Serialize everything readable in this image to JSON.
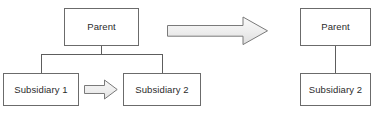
{
  "diagram": {
    "type": "before-after-org-restructure",
    "colors": {
      "box_stroke": "#6b6b6b",
      "box_fill": "#ffffff",
      "connector": "#5d5d5d",
      "arrow_stroke": "#7a7a7a",
      "arrow_fill_top": "#f4f4f4",
      "arrow_fill_bottom": "#e2e2e2",
      "text": "#2b2b2b",
      "background": "#ffffff"
    },
    "before": {
      "parent": {
        "label": "Parent"
      },
      "subsidiary_1": {
        "label": "Subsidiary 1"
      },
      "subsidiary_2": {
        "label": "Subsidiary 2"
      },
      "inline_arrow": {
        "direction": "right",
        "meaning": "merge-into"
      }
    },
    "transform_arrow": {
      "direction": "right",
      "meaning": "results-in"
    },
    "after": {
      "parent": {
        "label": "Parent"
      },
      "subsidiary_2": {
        "label": "Subsidiary 2"
      }
    }
  }
}
